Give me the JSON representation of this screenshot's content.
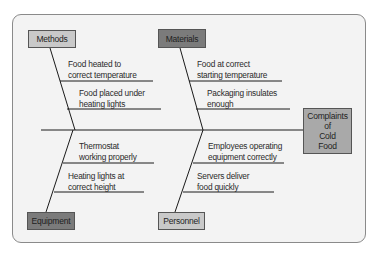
{
  "diagram": {
    "type": "fishbone",
    "effect": "Complaints\nof\nCold\nFood",
    "categories": {
      "methods": {
        "label": "Methods",
        "causes": [
          "Food heated to\ncorrect temperature",
          "Food placed under\nheating lights"
        ]
      },
      "materials": {
        "label": "Materials",
        "causes": [
          "Food at correct\nstarting temperature",
          "Packaging insulates\nenough"
        ]
      },
      "equipment": {
        "label": "Equipment",
        "causes": [
          "Thermostat\nworking properly",
          "Heating lights at\ncorrect height"
        ]
      },
      "personnel": {
        "label": "Personnel",
        "causes": [
          "Employees operating\nequipment correctly",
          "Servers deliver\nfood quickly"
        ]
      }
    }
  },
  "colors": {
    "panel_bg": "#f3f3f3",
    "light_box": "#c9c9c9",
    "dark_box": "#7b7b7b",
    "effect_box": "#a9a9a9",
    "line": "#1a1a1a"
  }
}
